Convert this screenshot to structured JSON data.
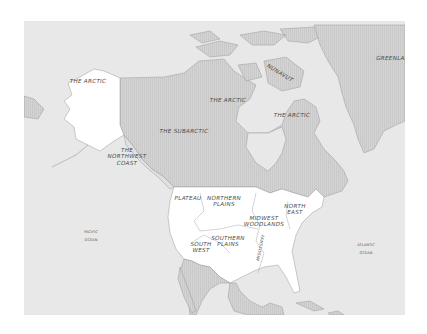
{
  "map": {
    "title": "Native North American culture areas",
    "colors": {
      "ocean": "#e8e8e8",
      "land_hatched": "#d2d2d2",
      "land_white": "#ffffff",
      "border": "#9a9a9a",
      "label": "#4a4a4a"
    },
    "regions": [
      {
        "id": "the-arctic-alaska",
        "label": "THE ARCTIC"
      },
      {
        "id": "the-arctic-central",
        "label": "THE ARCTIC"
      },
      {
        "id": "the-arctic-east",
        "label": "THE ARCTIC"
      },
      {
        "id": "the-subarctic",
        "label": "THE SUBARCTIC"
      },
      {
        "id": "the-northwest-coast",
        "label": "THE\nNORTHWEST\nCOAST"
      },
      {
        "id": "plateau",
        "label": "PLATEAU"
      },
      {
        "id": "northern-plains",
        "label": "NORTHERN\nPLAINS"
      },
      {
        "id": "midwest-woodlands",
        "label": "MIDWEST\nWOODLANDS"
      },
      {
        "id": "north-east",
        "label": "NORTH\nEAST"
      },
      {
        "id": "south-west",
        "label": "SOUTH\nWEST"
      },
      {
        "id": "southern-plains",
        "label": "SOUTHERN\nPLAINS"
      },
      {
        "id": "mississippi",
        "label": "MISSISSIPPI"
      },
      {
        "id": "nunavut",
        "label": "NUNAVUT"
      },
      {
        "id": "greenland",
        "label": "GREENLAND"
      }
    ],
    "oceans": [
      {
        "id": "pacific-ocean",
        "label": "PACIFIC\nOCEAN"
      },
      {
        "id": "atlantic-ocean",
        "label": "ATLANTIC\nOCEAN"
      }
    ]
  }
}
